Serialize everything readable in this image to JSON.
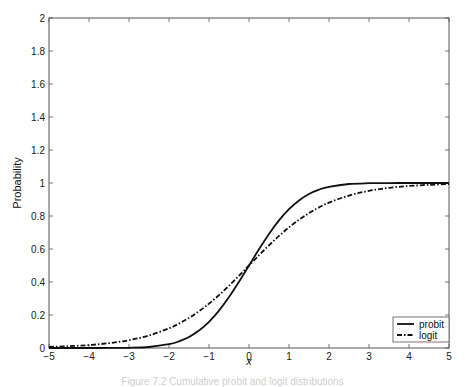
{
  "chart_data": {
    "type": "line",
    "title": "",
    "xlabel": "x",
    "ylabel": "Probability",
    "xlim": [
      -5,
      5
    ],
    "ylim": [
      0,
      2
    ],
    "xticks": [
      -5,
      -4,
      -3,
      -2,
      -1,
      0,
      1,
      2,
      3,
      4,
      5
    ],
    "yticks": [
      0,
      0.2,
      0.4,
      0.6,
      0.8,
      1,
      1.2,
      1.4,
      1.6,
      1.8,
      2
    ],
    "xtick_labels": [
      "−5",
      "−4",
      "−3",
      "−2",
      "−1",
      "0",
      "1",
      "2",
      "3",
      "4",
      "5"
    ],
    "ytick_labels": [
      "0",
      "0.2",
      "0.4",
      "0.6",
      "0.8",
      "1",
      "1.2",
      "1.4",
      "1.6",
      "1.8",
      "2"
    ],
    "grid": false,
    "legend_position": "lower right",
    "x": [
      -5,
      -4.5,
      -4,
      -3.5,
      -3,
      -2.5,
      -2,
      -1.75,
      -1.5,
      -1.25,
      -1,
      -0.75,
      -0.5,
      -0.25,
      0,
      0.25,
      0.5,
      0.75,
      1,
      1.25,
      1.5,
      1.75,
      2,
      2.5,
      3,
      3.5,
      4,
      4.5,
      5
    ],
    "series": [
      {
        "name": "probit",
        "style": "solid",
        "values": [
          0,
          0,
          3e-05,
          0.0002,
          0.00135,
          0.0062,
          0.0228,
          0.0401,
          0.0668,
          0.1056,
          0.1587,
          0.2266,
          0.3085,
          0.4013,
          0.5,
          0.5987,
          0.6915,
          0.7734,
          0.8413,
          0.8944,
          0.9332,
          0.9599,
          0.9772,
          0.9938,
          0.99865,
          0.9998,
          1,
          1,
          1
        ]
      },
      {
        "name": "logit",
        "style": "dash-dot",
        "values": [
          0.0067,
          0.011,
          0.018,
          0.0293,
          0.0474,
          0.0759,
          0.1192,
          0.148,
          0.1824,
          0.2227,
          0.2689,
          0.3208,
          0.3775,
          0.4378,
          0.5,
          0.5622,
          0.6225,
          0.6792,
          0.7311,
          0.7773,
          0.8176,
          0.852,
          0.8808,
          0.9241,
          0.9526,
          0.9707,
          0.982,
          0.989,
          0.9933
        ]
      }
    ]
  },
  "legend": {
    "items": [
      {
        "label": "probit",
        "style": "solid"
      },
      {
        "label": "logit",
        "style": "dash-dot"
      }
    ]
  },
  "caption": "Figure 7.2  Cumulative probit and logit distributions",
  "colors": {
    "axis": "#555555",
    "line": "#111111",
    "background": "#ffffff"
  }
}
